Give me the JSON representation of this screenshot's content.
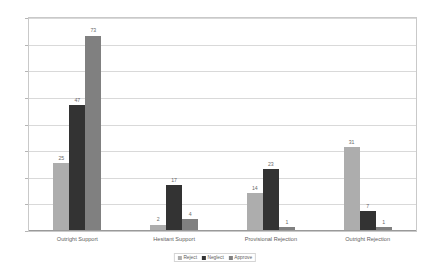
{
  "chart_data": {
    "type": "bar",
    "title": "",
    "xlabel": "",
    "ylabel": "",
    "ylim": [
      0,
      80
    ],
    "yticks": [
      0,
      10,
      20,
      30,
      40,
      50,
      60,
      70,
      80
    ],
    "grid": true,
    "legend_position": "bottom",
    "categories": [
      "Outright Support",
      "Hesitant Support",
      "Provisional Rejection",
      "Outright Rejection"
    ],
    "series": [
      {
        "name": "Reject",
        "color": "#adadad",
        "values": [
          25,
          2,
          14,
          31
        ]
      },
      {
        "name": "Neglect",
        "color": "#333333",
        "values": [
          47,
          17,
          23,
          7
        ]
      },
      {
        "name": "Approve",
        "color": "#808080",
        "values": [
          73,
          4,
          1,
          1
        ]
      }
    ]
  },
  "axis": {
    "y_tick_labels": [
      "0",
      "10",
      "20",
      "30",
      "40",
      "50",
      "60",
      "70",
      "80"
    ]
  },
  "labels": {
    "group_values": [
      [
        "25",
        "47",
        "73"
      ],
      [
        "2",
        "17",
        "4"
      ],
      [
        "14",
        "23",
        "1"
      ],
      [
        "31",
        "7",
        "1"
      ]
    ]
  },
  "legend": {
    "items": [
      {
        "label": "Reject",
        "color": "#adadad"
      },
      {
        "label": "Neglect",
        "color": "#333333"
      },
      {
        "label": "Approve",
        "color": "#808080"
      }
    ]
  },
  "artifact": {
    "top_text": ""
  },
  "colors": {
    "plot_border": "#c9c9c9",
    "gridline": "#d9d9d9",
    "baseline": "#9a9a9a",
    "text": "#5e5e5e",
    "background": "#ffffff"
  }
}
